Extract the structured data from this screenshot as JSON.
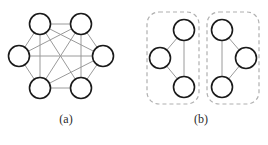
{
  "figure": {
    "width": 268,
    "height": 145,
    "background": "#ffffff"
  },
  "style": {
    "node_stroke": "#1a1a1a",
    "node_fill": "#ffffff",
    "node_stroke_width": 1.6,
    "node_radius": 10.5,
    "edge_color": "#9a9a9a",
    "edge_width": 1.0,
    "cluster_border_color": "#b0b0b0",
    "cluster_border_width": 1.2,
    "cluster_dash": "4,3",
    "cluster_corner_radius": 12,
    "caption_color": "#2b2b2b"
  },
  "panels": [
    {
      "id": "a",
      "caption": "(a)",
      "type": "graph",
      "nodes": [
        {
          "id": "n1",
          "label": "",
          "cx": 40,
          "cy": 24
        },
        {
          "id": "n2",
          "label": "",
          "cx": 81,
          "cy": 24
        },
        {
          "id": "n3",
          "label": "",
          "cx": 103,
          "cy": 56
        },
        {
          "id": "n4",
          "label": "",
          "cx": 81,
          "cy": 88
        },
        {
          "id": "n5",
          "label": "",
          "cx": 40,
          "cy": 88
        },
        {
          "id": "n6",
          "label": "",
          "cx": 19,
          "cy": 56
        }
      ],
      "edges": [
        {
          "from": "n1",
          "to": "n2"
        },
        {
          "from": "n1",
          "to": "n3"
        },
        {
          "from": "n1",
          "to": "n4"
        },
        {
          "from": "n1",
          "to": "n5"
        },
        {
          "from": "n1",
          "to": "n6"
        },
        {
          "from": "n2",
          "to": "n3"
        },
        {
          "from": "n2",
          "to": "n4"
        },
        {
          "from": "n2",
          "to": "n5"
        },
        {
          "from": "n2",
          "to": "n6"
        },
        {
          "from": "n3",
          "to": "n4"
        },
        {
          "from": "n3",
          "to": "n5"
        },
        {
          "from": "n3",
          "to": "n6"
        },
        {
          "from": "n4",
          "to": "n5"
        },
        {
          "from": "n5",
          "to": "n6"
        }
      ]
    },
    {
      "id": "b",
      "caption": "(b)",
      "type": "clustered-graph",
      "clusters": [
        {
          "id": "cluster-left",
          "box": {
            "x": 147,
            "y": 12,
            "width": 52,
            "height": 92
          },
          "nodes": [
            {
              "id": "m1",
              "label": "",
              "cx": 184,
              "cy": 30
            },
            {
              "id": "m2",
              "label": "",
              "cx": 160,
              "cy": 58
            },
            {
              "id": "m3",
              "label": "",
              "cx": 184,
              "cy": 87
            }
          ],
          "edges": [
            {
              "from": "m1",
              "to": "m2"
            },
            {
              "from": "m2",
              "to": "m3"
            },
            {
              "from": "m1",
              "to": "m3"
            }
          ]
        },
        {
          "id": "cluster-right",
          "box": {
            "x": 207,
            "y": 12,
            "width": 52,
            "height": 92
          },
          "nodes": [
            {
              "id": "p1",
              "label": "",
              "cx": 222,
              "cy": 30
            },
            {
              "id": "p2",
              "label": "",
              "cx": 246,
              "cy": 58
            },
            {
              "id": "p3",
              "label": "",
              "cx": 222,
              "cy": 87
            }
          ],
          "edges": [
            {
              "from": "p1",
              "to": "p2"
            },
            {
              "from": "p2",
              "to": "p3"
            },
            {
              "from": "p1",
              "to": "p3"
            }
          ]
        }
      ]
    }
  ]
}
